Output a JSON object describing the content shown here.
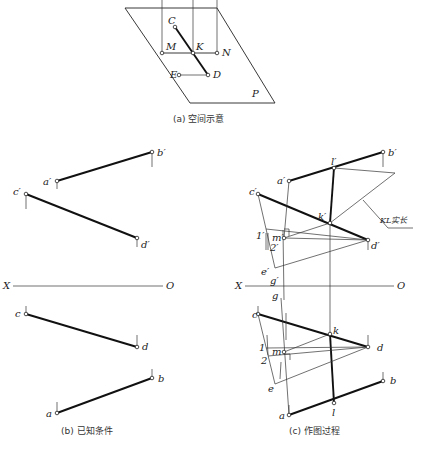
{
  "panel_a": {
    "caption": "(a) 空间示意",
    "plane_label": "P",
    "points": {
      "C": "C",
      "M": "M",
      "K": "K",
      "N": "N",
      "E": "E",
      "D": "D"
    }
  },
  "panel_b": {
    "caption": "(b) 已知条件",
    "axis": {
      "x": "X",
      "o": "O"
    },
    "points": {
      "a1": "a′",
      "b1": "b′",
      "c1": "c′",
      "d1": "d′",
      "a": "a",
      "b": "b",
      "c": "c",
      "d": "d"
    }
  },
  "panel_c": {
    "caption": "(c) 作图过程",
    "axis": {
      "x": "X",
      "o": "O"
    },
    "annotation": "KL实长",
    "points": {
      "a1": "a′",
      "b1": "b′",
      "c1": "c′",
      "d1": "d′",
      "k1": "k′",
      "l1": "l′",
      "m1": "m′",
      "e1": "e′",
      "g1": "g′",
      "n1": "1′",
      "n2": "2′",
      "a": "a",
      "b": "b",
      "c": "c",
      "d": "d",
      "k": "k",
      "l": "l",
      "m": "m",
      "e": "e",
      "g": "g",
      "one": "1",
      "two": "2"
    }
  }
}
